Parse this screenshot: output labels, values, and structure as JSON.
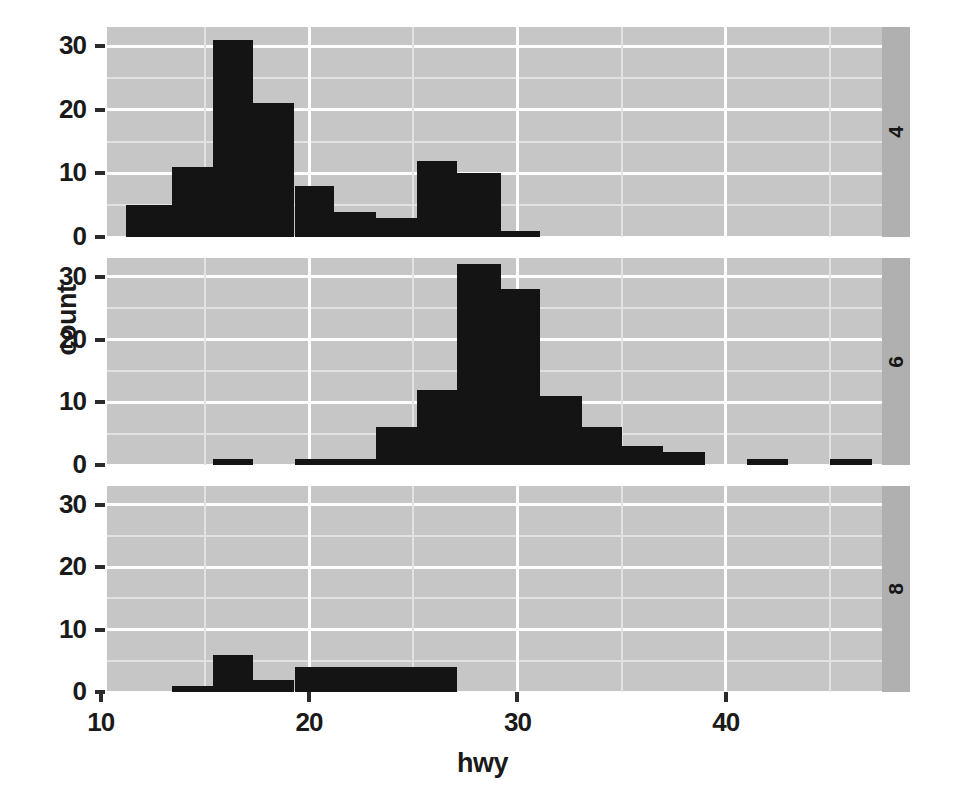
{
  "chart_data": {
    "type": "bar",
    "chart_kind": "faceted-histogram",
    "title": "",
    "subtitle": "",
    "xlabel": "hwy",
    "ylabel": "count",
    "xlim": [
      10.3,
      47.5
    ],
    "ylim": [
      0,
      33
    ],
    "x_ticks": [
      10,
      20,
      30,
      40
    ],
    "y_ticks": [
      0,
      10,
      20,
      30
    ],
    "grid": true,
    "legend": "none",
    "bin_width": 2,
    "facet_variable": "cyl",
    "facet_position": "right-strip",
    "panel_background": "#c6c6c6",
    "bar_color": "#141414",
    "gridline_major_color": "#fdfdfd",
    "gridline_minor_color": "#e2e2e2",
    "strip_background": "#b0b0b0",
    "panels": [
      {
        "strip_label": "4",
        "bins": [
          {
            "x0": 11.2,
            "x1": 13.4,
            "count": 5
          },
          {
            "x0": 13.4,
            "x1": 15.4,
            "count": 11
          },
          {
            "x0": 15.4,
            "x1": 17.3,
            "count": 31
          },
          {
            "x0": 17.3,
            "x1": 19.3,
            "count": 21
          },
          {
            "x0": 19.3,
            "x1": 21.2,
            "count": 8
          },
          {
            "x0": 21.2,
            "x1": 23.2,
            "count": 4
          },
          {
            "x0": 23.2,
            "x1": 25.2,
            "count": 3
          },
          {
            "x0": 25.2,
            "x1": 27.1,
            "count": 12
          },
          {
            "x0": 27.1,
            "x1": 29.2,
            "count": 10
          },
          {
            "x0": 29.2,
            "x1": 31.1,
            "count": 1
          }
        ]
      },
      {
        "strip_label": "6",
        "bins": [
          {
            "x0": 15.4,
            "x1": 17.3,
            "count": 1
          },
          {
            "x0": 19.3,
            "x1": 21.2,
            "count": 1
          },
          {
            "x0": 21.2,
            "x1": 23.2,
            "count": 1
          },
          {
            "x0": 23.2,
            "x1": 25.2,
            "count": 6
          },
          {
            "x0": 25.2,
            "x1": 27.1,
            "count": 12
          },
          {
            "x0": 27.1,
            "x1": 29.2,
            "count": 32
          },
          {
            "x0": 29.2,
            "x1": 31.1,
            "count": 28
          },
          {
            "x0": 31.1,
            "x1": 33.1,
            "count": 11
          },
          {
            "x0": 33.1,
            "x1": 35.0,
            "count": 6
          },
          {
            "x0": 35.0,
            "x1": 37.0,
            "count": 3
          },
          {
            "x0": 37.0,
            "x1": 39.0,
            "count": 2
          },
          {
            "x0": 41.0,
            "x1": 43.0,
            "count": 1
          },
          {
            "x0": 45.0,
            "x1": 47.0,
            "count": 1
          }
        ]
      },
      {
        "strip_label": "8",
        "bins": [
          {
            "x0": 13.4,
            "x1": 15.4,
            "count": 1
          },
          {
            "x0": 15.4,
            "x1": 17.3,
            "count": 6
          },
          {
            "x0": 17.3,
            "x1": 19.3,
            "count": 2
          },
          {
            "x0": 19.3,
            "x1": 21.2,
            "count": 4
          },
          {
            "x0": 21.2,
            "x1": 23.2,
            "count": 4
          },
          {
            "x0": 23.2,
            "x1": 25.2,
            "count": 4
          },
          {
            "x0": 25.2,
            "x1": 27.1,
            "count": 4
          }
        ]
      }
    ]
  },
  "axes": {
    "x_title": "hwy",
    "y_title": "count",
    "x_tick_labels": [
      "10",
      "20",
      "30",
      "40"
    ],
    "y_tick_labels": [
      "0",
      "10",
      "20",
      "30"
    ]
  }
}
